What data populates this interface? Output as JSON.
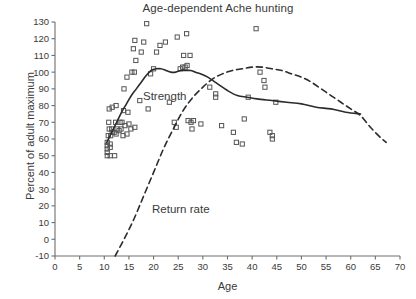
{
  "chart_data": {
    "type": "scatter",
    "title": "Age-dependent Ache hunting",
    "xlabel": "Age",
    "ylabel": "Percent of adult maximum",
    "xlim": [
      0,
      70
    ],
    "ylim": [
      -10,
      130
    ],
    "xticks": [
      0,
      5,
      10,
      15,
      20,
      25,
      30,
      35,
      40,
      45,
      50,
      55,
      60,
      65,
      70
    ],
    "yticks": [
      -10,
      0,
      10,
      20,
      30,
      40,
      50,
      60,
      70,
      80,
      90,
      100,
      110,
      120,
      130
    ],
    "grid": false,
    "legend_position": "inline-annotation",
    "annotations": [
      {
        "text": "Strength",
        "x": 19,
        "y": 84
      },
      {
        "text": "Return rate",
        "x": 21,
        "y": 19
      }
    ],
    "scatter": {
      "name": "Individual observations",
      "marker": "open-square",
      "color": "#555555",
      "points": [
        [
          10.6,
          50
        ],
        [
          10.6,
          52
        ],
        [
          10.6,
          54
        ],
        [
          10.6,
          56
        ],
        [
          10.6,
          58
        ],
        [
          11.2,
          50
        ],
        [
          11.2,
          55
        ],
        [
          11.2,
          57
        ],
        [
          12.1,
          50
        ],
        [
          10.8,
          62
        ],
        [
          11.3,
          62
        ],
        [
          11.6,
          64
        ],
        [
          12.0,
          64
        ],
        [
          12.4,
          63
        ],
        [
          11.0,
          66
        ],
        [
          11.5,
          66
        ],
        [
          12.6,
          66
        ],
        [
          13.0,
          65
        ],
        [
          13.4,
          66
        ],
        [
          10.9,
          70
        ],
        [
          12.3,
          70
        ],
        [
          13.2,
          70
        ],
        [
          13.6,
          70
        ],
        [
          11.0,
          78
        ],
        [
          11.6,
          79
        ],
        [
          12.4,
          80
        ],
        [
          13.8,
          62
        ],
        [
          14.6,
          63
        ],
        [
          15.4,
          66
        ],
        [
          14.2,
          68
        ],
        [
          15.0,
          69
        ],
        [
          16.2,
          67
        ],
        [
          13.9,
          77
        ],
        [
          14.8,
          76
        ],
        [
          14.0,
          90
        ],
        [
          14.6,
          97
        ],
        [
          15.6,
          100
        ],
        [
          16.1,
          100
        ],
        [
          16.4,
          107
        ],
        [
          15.9,
          114
        ],
        [
          16.2,
          119
        ],
        [
          17.5,
          112
        ],
        [
          18.0,
          118
        ],
        [
          18.6,
          129
        ],
        [
          19.4,
          99
        ],
        [
          20.0,
          102
        ],
        [
          20.6,
          112
        ],
        [
          21.3,
          116
        ],
        [
          17.2,
          83
        ],
        [
          18.9,
          78
        ],
        [
          22.4,
          118
        ],
        [
          24.8,
          121
        ],
        [
          26.1,
          110
        ],
        [
          26.7,
          123
        ],
        [
          25.4,
          102
        ],
        [
          25.9,
          103
        ],
        [
          26.4,
          103
        ],
        [
          26.8,
          104
        ],
        [
          27.4,
          110
        ],
        [
          23.2,
          82
        ],
        [
          24.2,
          70
        ],
        [
          24.6,
          67
        ],
        [
          27.0,
          71
        ],
        [
          27.6,
          70
        ],
        [
          28.1,
          71
        ],
        [
          27.8,
          66
        ],
        [
          29.6,
          69
        ],
        [
          31.4,
          91
        ],
        [
          32.6,
          85
        ],
        [
          32.6,
          87
        ],
        [
          33.8,
          68
        ],
        [
          36.2,
          64
        ],
        [
          38.4,
          72
        ],
        [
          39.2,
          85
        ],
        [
          41.6,
          100
        ],
        [
          42.4,
          95
        ],
        [
          42.6,
          91
        ],
        [
          40.8,
          126
        ],
        [
          44.8,
          82
        ],
        [
          43.6,
          64
        ],
        [
          44.1,
          62
        ],
        [
          44.1,
          60
        ],
        [
          36.8,
          58
        ],
        [
          38.0,
          57
        ]
      ]
    },
    "series": [
      {
        "name": "Strength",
        "style": "solid",
        "color": "#2b2b2b",
        "points": [
          [
            10.5,
            58
          ],
          [
            11.5,
            64
          ],
          [
            12.5,
            70
          ],
          [
            13.5,
            76
          ],
          [
            14.5,
            81
          ],
          [
            15.5,
            86
          ],
          [
            16.5,
            90
          ],
          [
            17.5,
            94
          ],
          [
            18.5,
            98
          ],
          [
            19.5,
            101
          ],
          [
            20.5,
            102
          ],
          [
            21.5,
            102
          ],
          [
            22.5,
            101
          ],
          [
            23.5,
            100
          ],
          [
            24.5,
            100
          ],
          [
            25.5,
            101
          ],
          [
            26.5,
            101
          ],
          [
            27.5,
            101
          ],
          [
            28.5,
            100
          ],
          [
            29.5,
            99
          ],
          [
            31.0,
            97
          ],
          [
            33.0,
            93
          ],
          [
            35.0,
            89
          ],
          [
            37.0,
            86
          ],
          [
            39.0,
            85
          ],
          [
            41.0,
            84
          ],
          [
            44.0,
            83
          ],
          [
            47.0,
            82
          ],
          [
            50.0,
            81
          ],
          [
            53.0,
            79
          ],
          [
            56.0,
            78
          ],
          [
            59.0,
            76
          ],
          [
            62.0,
            75
          ]
        ]
      },
      {
        "name": "Return rate",
        "style": "dashed",
        "color": "#2b2b2b",
        "points": [
          [
            12.2,
            -10
          ],
          [
            14.0,
            0
          ],
          [
            16.0,
            12
          ],
          [
            18.0,
            26
          ],
          [
            20.0,
            40
          ],
          [
            22.0,
            54
          ],
          [
            24.0,
            66
          ],
          [
            26.0,
            77
          ],
          [
            28.0,
            85
          ],
          [
            30.0,
            91
          ],
          [
            32.0,
            96
          ],
          [
            34.0,
            99
          ],
          [
            36.0,
            101
          ],
          [
            38.0,
            102
          ],
          [
            40.0,
            103
          ],
          [
            42.0,
            103
          ],
          [
            44.0,
            102
          ],
          [
            46.0,
            101
          ],
          [
            48.0,
            99
          ],
          [
            50.0,
            97
          ],
          [
            52.0,
            94
          ],
          [
            54.0,
            90
          ],
          [
            56.0,
            86
          ],
          [
            58.0,
            82
          ],
          [
            60.0,
            78
          ],
          [
            62.0,
            74
          ],
          [
            64.0,
            67
          ],
          [
            66.0,
            61
          ],
          [
            67.2,
            58
          ]
        ]
      }
    ]
  }
}
